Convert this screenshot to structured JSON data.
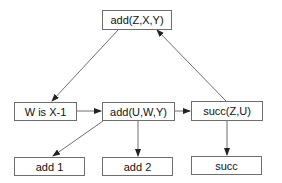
{
  "diagram": {
    "nodes": [
      {
        "id": "top",
        "label": "add(Z,X,Y)"
      },
      {
        "id": "w",
        "label": "W is X-1"
      },
      {
        "id": "mid",
        "label": "add(U,W,Y)"
      },
      {
        "id": "succ",
        "label": "succ(Z,U)"
      },
      {
        "id": "add1",
        "label": "add 1"
      },
      {
        "id": "add2",
        "label": "add 2"
      },
      {
        "id": "succ_leaf",
        "label": "succ"
      }
    ],
    "edges": [
      {
        "from": "top",
        "to": "w"
      },
      {
        "from": "w",
        "to": "mid"
      },
      {
        "from": "mid",
        "to": "succ"
      },
      {
        "from": "succ",
        "to": "top"
      },
      {
        "from": "mid",
        "to": "add1"
      },
      {
        "from": "mid",
        "to": "add2"
      },
      {
        "from": "succ",
        "to": "succ_leaf"
      }
    ],
    "colors": {
      "stroke": "#6e6e6e",
      "arrow": "#222222"
    }
  }
}
